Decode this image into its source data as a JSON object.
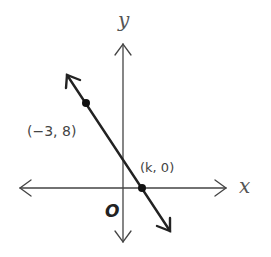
{
  "diagram": {
    "axes": {
      "x_label": "x",
      "y_label": "y",
      "origin_label": "O"
    },
    "line": {
      "direction": "negative slope",
      "points": [
        {
          "label": "(−3, 8)",
          "x": -3,
          "y": 8
        },
        {
          "label": "(k, 0)",
          "x": "k",
          "y": 0
        }
      ]
    },
    "colors": {
      "axis": "#444444",
      "line": "#222222",
      "point": "#111111",
      "text": "#444444"
    }
  }
}
